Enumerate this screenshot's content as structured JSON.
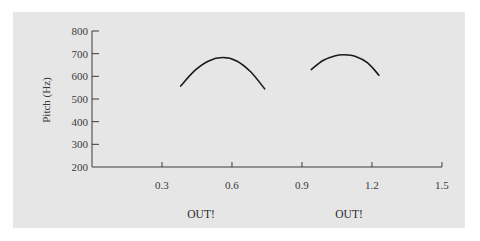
{
  "chart_data": {
    "type": "line",
    "title": "",
    "xlabel": "",
    "ylabel": "Pitch (Hz)",
    "xlim": [
      0,
      1.5
    ],
    "ylim": [
      200,
      800
    ],
    "x_ticks": [
      "0.3",
      "0.6",
      "0.9",
      "1.2",
      "1.5"
    ],
    "y_ticks": [
      "200",
      "300",
      "400",
      "500",
      "600",
      "700",
      "800"
    ],
    "grid": false,
    "series": [
      {
        "name": "OUT! (1)",
        "x": [
          0.38,
          0.44,
          0.5,
          0.56,
          0.62,
          0.68,
          0.74
        ],
        "values": [
          557,
          625,
          668,
          683,
          668,
          620,
          545
        ]
      },
      {
        "name": "OUT! (2)",
        "x": [
          0.94,
          0.99,
          1.04,
          1.08,
          1.13,
          1.18,
          1.23
        ],
        "values": [
          630,
          670,
          690,
          695,
          688,
          660,
          605
        ]
      }
    ],
    "annotations": [
      {
        "text": "OUT!",
        "x": 0.56
      },
      {
        "text": "OUT!",
        "x": 1.08
      }
    ]
  },
  "labels": {
    "ylabel": "Pitch (Hz)",
    "word1": "OUT!",
    "word2": "OUT!"
  },
  "colors": {
    "background": "#e6e6e6",
    "line": "#1a1a1a",
    "axis": "#3a3a3a"
  }
}
